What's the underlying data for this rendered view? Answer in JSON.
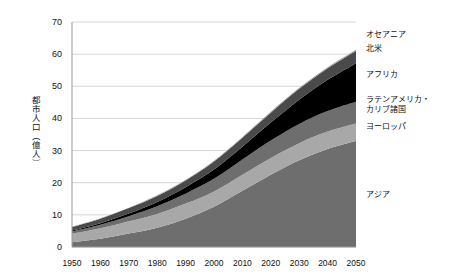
{
  "chart_data": {
    "type": "area",
    "stacked": true,
    "title": "",
    "xlabel": "",
    "ylabel": "都市人口（億人）",
    "x": [
      1950,
      1960,
      1970,
      1980,
      1990,
      2000,
      2010,
      2020,
      2030,
      2040,
      2050
    ],
    "xtick_labels": [
      "1950",
      "1960",
      "1970",
      "1980",
      "1990",
      "2000",
      "2010",
      "2020",
      "2030",
      "2040",
      "2050"
    ],
    "xlim": [
      1950,
      2050
    ],
    "ylim": [
      0,
      70
    ],
    "ytick_labels": [
      "0",
      "10",
      "20",
      "30",
      "40",
      "50",
      "60",
      "70"
    ],
    "yticks": [
      0,
      10,
      20,
      30,
      40,
      50,
      60,
      70
    ],
    "grid": true,
    "legend_position": "right-inline",
    "series": [
      {
        "name": "アジア",
        "color": "#6e6e6e",
        "values": [
          1.5,
          2.6,
          4.2,
          6.0,
          8.8,
          12.5,
          17.5,
          22.5,
          27.0,
          30.5,
          33.0
        ]
      },
      {
        "name": "ヨーロッパ",
        "color": "#a8a8a8",
        "values": [
          2.6,
          3.2,
          3.8,
          4.3,
          4.7,
          4.8,
          5.0,
          5.2,
          5.3,
          5.4,
          5.4
        ]
      },
      {
        "name": "ラテンアメリカ・カリブ諸国",
        "color": "#6e6e6e",
        "values": [
          0.7,
          1.1,
          1.6,
          2.4,
          3.1,
          3.9,
          4.7,
          5.4,
          6.0,
          6.4,
          6.8
        ]
      },
      {
        "name": "アフリカ",
        "color": "#000000",
        "values": [
          0.3,
          0.5,
          0.8,
          1.3,
          2.0,
          2.9,
          4.0,
          5.6,
          7.5,
          9.7,
          12.0
        ]
      },
      {
        "name": "北米",
        "color": "#4a4a4a",
        "values": [
          1.1,
          1.4,
          1.7,
          1.9,
          2.1,
          2.5,
          2.8,
          3.1,
          3.4,
          3.6,
          3.8
        ]
      },
      {
        "name": "オセアニア",
        "color": "#9c9c9c",
        "values": [
          0.08,
          0.11,
          0.14,
          0.17,
          0.19,
          0.22,
          0.25,
          0.28,
          0.31,
          0.34,
          0.37
        ]
      }
    ],
    "legend_entries": [
      {
        "label": "オセアニア"
      },
      {
        "label": "北米"
      },
      {
        "label": "アフリカ"
      },
      {
        "label": "ラテンアメリカ・\nカリブ諸国"
      },
      {
        "label": "ヨーロッパ"
      },
      {
        "label": "アジア"
      }
    ]
  },
  "axis": {
    "y_title": "都市人口（億人）"
  },
  "colors": {
    "axis_line": "#999999",
    "grid_line": "#cccccc",
    "text": "#111111",
    "background": "#ffffff"
  }
}
